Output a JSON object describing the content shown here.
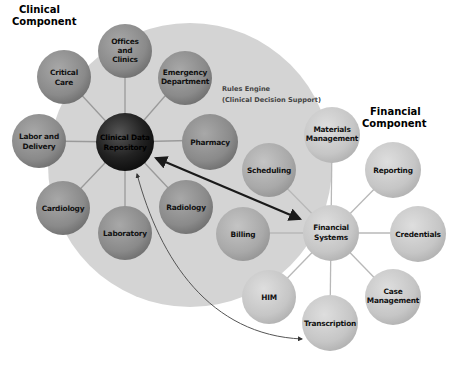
{
  "headings": {
    "clinical": [
      "Clinical",
      "Component"
    ],
    "financial": [
      "Financial",
      "Component"
    ]
  },
  "rules_engine": [
    "Rules Engine",
    "(Clinical Decision Support)"
  ],
  "clinical_hub": {
    "label": [
      "Clinical Data",
      "Repository"
    ]
  },
  "clinical_nodes": [
    {
      "id": "offices-and-clinics",
      "label": [
        "Offices",
        "and",
        "Clinics"
      ]
    },
    {
      "id": "critical-care",
      "label": [
        "Critical",
        "Care"
      ]
    },
    {
      "id": "emergency-department",
      "label": [
        "Emergency",
        "Department"
      ]
    },
    {
      "id": "labor-and-delivery",
      "label": [
        "Labor and",
        "Delivery"
      ]
    },
    {
      "id": "pharmacy",
      "label": [
        "Pharmacy"
      ]
    },
    {
      "id": "cardiology",
      "label": [
        "Cardiology"
      ]
    },
    {
      "id": "laboratory",
      "label": [
        "Laboratory"
      ]
    },
    {
      "id": "radiology",
      "label": [
        "Radiology"
      ]
    }
  ],
  "financial_hub": {
    "label": [
      "Financial",
      "Systems"
    ]
  },
  "financial_nodes": [
    {
      "id": "materials-management",
      "label": [
        "Materials",
        "Management"
      ]
    },
    {
      "id": "scheduling",
      "label": [
        "Scheduling"
      ]
    },
    {
      "id": "reporting",
      "label": [
        "Reporting"
      ]
    },
    {
      "id": "billing",
      "label": [
        "Billing"
      ]
    },
    {
      "id": "credentials",
      "label": [
        "Credentials"
      ]
    },
    {
      "id": "him",
      "label": [
        "HIM"
      ]
    },
    {
      "id": "case-management",
      "label": [
        "Case",
        "Management"
      ]
    },
    {
      "id": "transcription",
      "label": [
        "Transcription"
      ]
    }
  ],
  "colors": {
    "background_circle": "#d4d4d4",
    "clinical_node": "#8c8c8c",
    "clinical_hub": "#1e1e1e",
    "financial_node": "#c9c9c9",
    "arrow": "#1a1a1a"
  }
}
